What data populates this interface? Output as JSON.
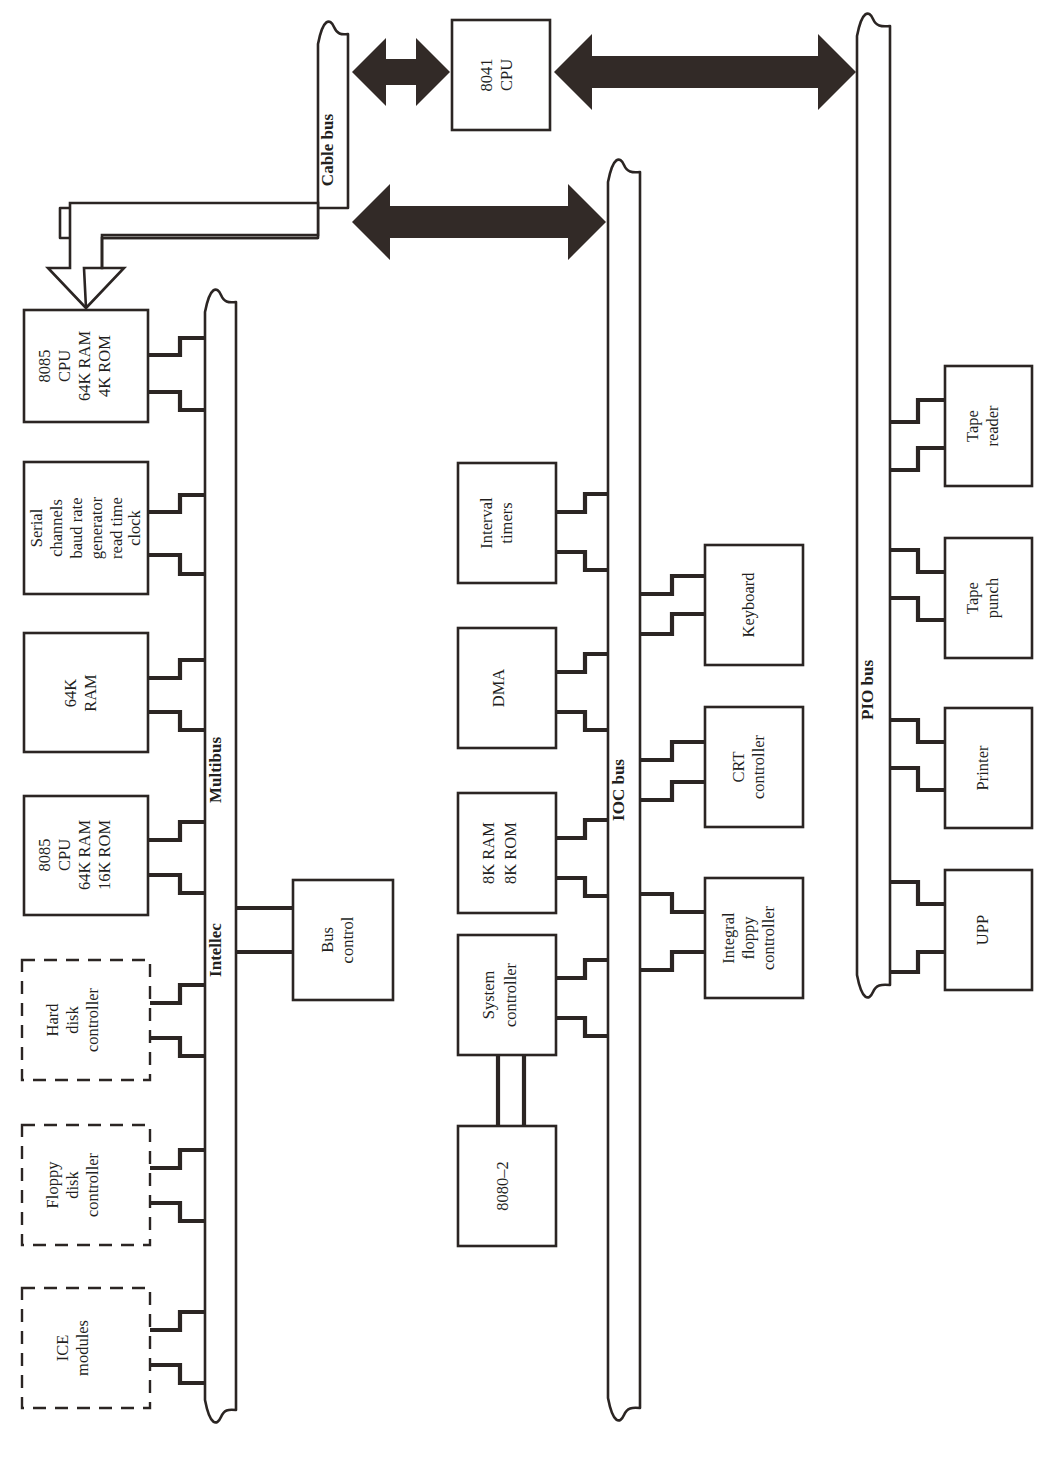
{
  "diagram": {
    "ink_color": "#2b2523",
    "arrow_fill": "#322a27",
    "background": "#ffffff"
  },
  "buses": [
    {
      "id": "cable-bus",
      "label": "Cable bus"
    },
    {
      "id": "multibus",
      "label": "Multibus"
    },
    {
      "id": "intellec",
      "label": "Intellec"
    },
    {
      "id": "ioc-bus",
      "label": "IOC bus"
    },
    {
      "id": "pio-bus",
      "label": "PIO bus"
    }
  ],
  "boxes": {
    "cpu_8041": {
      "lines": [
        "8041",
        "CPU"
      ],
      "style": "solid"
    },
    "cpu_8085_4k": {
      "lines": [
        "8085",
        "CPU",
        "64K RAM",
        "4K ROM"
      ],
      "style": "solid"
    },
    "serial_channels": {
      "lines": [
        "Serial",
        "channels",
        "baud rate",
        "generator",
        "read time",
        "clock"
      ],
      "style": "solid"
    },
    "ram_64k": {
      "lines": [
        "64K",
        "RAM"
      ],
      "style": "solid"
    },
    "cpu_8085_16k": {
      "lines": [
        "8085",
        "CPU",
        "64K RAM",
        "16K ROM"
      ],
      "style": "solid"
    },
    "hard_disk": {
      "lines": [
        "Hard",
        "disk",
        "controller"
      ],
      "style": "dashed"
    },
    "floppy_disk": {
      "lines": [
        "Floppy",
        "disk",
        "controller"
      ],
      "style": "dashed"
    },
    "ice_modules": {
      "lines": [
        "ICE",
        "modules"
      ],
      "style": "dashed"
    },
    "bus_control": {
      "lines": [
        "Bus",
        "control"
      ],
      "style": "solid"
    },
    "interval_timers": {
      "lines": [
        "Interval",
        "timers"
      ],
      "style": "solid"
    },
    "dma": {
      "lines": [
        "DMA"
      ],
      "style": "solid"
    },
    "ram_rom_8k": {
      "lines": [
        "8K RAM",
        "8K ROM"
      ],
      "style": "solid"
    },
    "system_ctrl": {
      "lines": [
        "System",
        "controller"
      ],
      "style": "solid"
    },
    "cpu_8080_2": {
      "lines": [
        "8080–2"
      ],
      "style": "solid"
    },
    "keyboard": {
      "lines": [
        "Keyboard"
      ],
      "style": "solid"
    },
    "crt_controller": {
      "lines": [
        "CRT",
        "controller"
      ],
      "style": "solid"
    },
    "integral_floppy": {
      "lines": [
        "Integral",
        "floppy",
        "controller"
      ],
      "style": "solid"
    },
    "tape_reader": {
      "lines": [
        "Tape",
        "reader"
      ],
      "style": "solid"
    },
    "tape_punch": {
      "lines": [
        "Tape",
        "punch"
      ],
      "style": "solid"
    },
    "printer": {
      "lines": [
        "Printer"
      ],
      "style": "solid"
    },
    "upp": {
      "lines": [
        "UPP"
      ],
      "style": "solid"
    }
  }
}
